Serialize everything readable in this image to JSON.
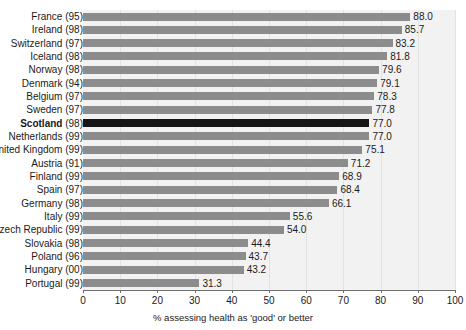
{
  "chart_data": {
    "type": "bar",
    "orientation": "horizontal",
    "title": "",
    "xlabel": "% assessing health as 'good' or better",
    "ylabel": "",
    "xlim": [
      0,
      100
    ],
    "xticks": [
      0,
      10,
      20,
      30,
      40,
      50,
      60,
      70,
      80,
      90,
      100
    ],
    "grid": true,
    "grid_axis": "x",
    "legend": "none",
    "categories": [
      "France (95)",
      "Ireland (98)",
      "Switzerland (97)",
      "Iceland (98)",
      "Norway (98)",
      "Denmark (94)",
      "Belgium (97)",
      "Sweden (97)",
      "Scotland (98)",
      "Netherlands (99)",
      "United Kingdom (99)",
      "Austria (91)",
      "Finland (99)",
      "Spain (97)",
      "Germany (98)",
      "Italy (99)",
      "Czech Republic (99)",
      "Slovakia (98)",
      "Poland (96)",
      "Hungary (00)",
      "Portugal (99)"
    ],
    "values": [
      88.0,
      85.7,
      83.2,
      81.8,
      79.6,
      79.1,
      78.3,
      77.8,
      77.0,
      77.0,
      75.1,
      71.2,
      68.9,
      68.4,
      66.1,
      55.6,
      54.0,
      44.4,
      43.7,
      43.2,
      31.3
    ],
    "value_labels": [
      "88.0",
      "85.7",
      "83.2",
      "81.8",
      "79.6",
      "79.1",
      "78.3",
      "77.8",
      "77.0",
      "77.0",
      "75.1",
      "71.2",
      "68.9",
      "68.4",
      "66.1",
      "55.6",
      "54.0",
      "44.4",
      "43.7",
      "43.2",
      "31.3"
    ],
    "highlight_index": 8,
    "colors": {
      "bar": "#8c8c8c",
      "bar_highlight": "#151515",
      "plot_background": "#f2f2f2",
      "gridline": "#e2e2e2",
      "axis": "#6f6f6f",
      "text": "#1a1a1a"
    }
  },
  "rows": [
    {
      "country": "France",
      "year": "(95)",
      "label": "France (95)",
      "value": 88.0,
      "value_label": "88.0",
      "highlight": false
    },
    {
      "country": "Ireland",
      "year": "(98)",
      "label": "Ireland (98)",
      "value": 85.7,
      "value_label": "85.7",
      "highlight": false
    },
    {
      "country": "Switzerland",
      "year": "(97)",
      "label": "Switzerland (97)",
      "value": 83.2,
      "value_label": "83.2",
      "highlight": false
    },
    {
      "country": "Iceland",
      "year": "(98)",
      "label": "Iceland (98)",
      "value": 81.8,
      "value_label": "81.8",
      "highlight": false
    },
    {
      "country": "Norway",
      "year": "(98)",
      "label": "Norway (98)",
      "value": 79.6,
      "value_label": "79.6",
      "highlight": false
    },
    {
      "country": "Denmark",
      "year": "(94)",
      "label": "Denmark (94)",
      "value": 79.1,
      "value_label": "79.1",
      "highlight": false
    },
    {
      "country": "Belgium",
      "year": "(97)",
      "label": "Belgium (97)",
      "value": 78.3,
      "value_label": "78.3",
      "highlight": false
    },
    {
      "country": "Sweden",
      "year": "(97)",
      "label": "Sweden (97)",
      "value": 77.8,
      "value_label": "77.8",
      "highlight": false
    },
    {
      "country": "Scotland",
      "year": "(98)",
      "label": "Scotland (98)",
      "value": 77.0,
      "value_label": "77.0",
      "highlight": true
    },
    {
      "country": "Netherlands",
      "year": "(99)",
      "label": "Netherlands (99)",
      "value": 77.0,
      "value_label": "77.0",
      "highlight": false
    },
    {
      "country": "United Kingdom",
      "year": "(99)",
      "label": "United Kingdom (99)",
      "value": 75.1,
      "value_label": "75.1",
      "highlight": false
    },
    {
      "country": "Austria",
      "year": "(91)",
      "label": "Austria (91)",
      "value": 71.2,
      "value_label": "71.2",
      "highlight": false
    },
    {
      "country": "Finland",
      "year": "(99)",
      "label": "Finland (99)",
      "value": 68.9,
      "value_label": "68.9",
      "highlight": false
    },
    {
      "country": "Spain",
      "year": "(97)",
      "label": "Spain (97)",
      "value": 68.4,
      "value_label": "68.4",
      "highlight": false
    },
    {
      "country": "Germany",
      "year": "(98)",
      "label": "Germany (98)",
      "value": 66.1,
      "value_label": "66.1",
      "highlight": false
    },
    {
      "country": "Italy",
      "year": "(99)",
      "label": "Italy (99)",
      "value": 55.6,
      "value_label": "55.6",
      "highlight": false
    },
    {
      "country": "Czech Republic",
      "year": "(99)",
      "label": "Czech Republic (99)",
      "value": 54.0,
      "value_label": "54.0",
      "highlight": false
    },
    {
      "country": "Slovakia",
      "year": "(98)",
      "label": "Slovakia (98)",
      "value": 44.4,
      "value_label": "44.4",
      "highlight": false
    },
    {
      "country": "Poland",
      "year": "(96)",
      "label": "Poland (96)",
      "value": 43.7,
      "value_label": "43.7",
      "highlight": false
    },
    {
      "country": "Hungary",
      "year": "(00)",
      "label": "Hungary (00)",
      "value": 43.2,
      "value_label": "43.2",
      "highlight": false
    },
    {
      "country": "Portugal",
      "year": "(99)",
      "label": "Portugal (99)",
      "value": 31.3,
      "value_label": "31.3",
      "highlight": false
    }
  ],
  "axis": {
    "ticks": [
      "0",
      "10",
      "20",
      "30",
      "40",
      "50",
      "60",
      "70",
      "80",
      "90",
      "100"
    ],
    "title": "% assessing health as 'good' or better"
  }
}
